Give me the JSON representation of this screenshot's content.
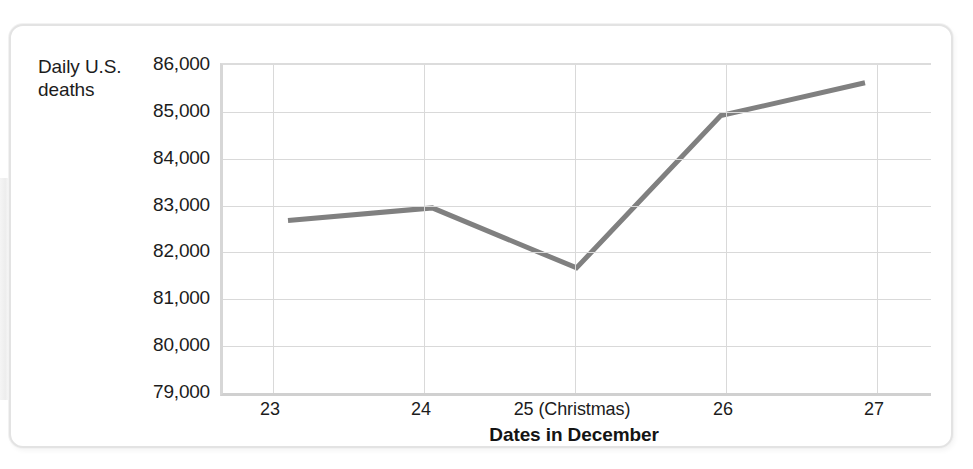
{
  "figure": {
    "y_axis_title_line1": "Daily U.S.",
    "y_axis_title_line2": "deaths",
    "x_axis_title": "Dates in December"
  },
  "chart_data": {
    "type": "line",
    "title": "",
    "xlabel": "Dates in December",
    "ylabel": "Daily U.S. deaths",
    "categories": [
      "23",
      "24",
      "25 (Christmas)",
      "26",
      "27"
    ],
    "values": [
      82680,
      82950,
      81670,
      84920,
      85620
    ],
    "series": [
      {
        "name": "Daily U.S. deaths",
        "values": [
          82680,
          82950,
          81670,
          84920,
          85620
        ],
        "color": "#808080"
      }
    ],
    "ylim": [
      79000,
      86000
    ],
    "ytick_labels": [
      "86,000",
      "85,000",
      "84,000",
      "83,000",
      "82,000",
      "81,000",
      "80,000",
      "79,000"
    ],
    "ytick_values": [
      86000,
      85000,
      84000,
      83000,
      82000,
      81000,
      80000,
      79000
    ],
    "grid": true,
    "legend": "none",
    "line_color": "#808080",
    "line_width": 5,
    "markers": false
  }
}
